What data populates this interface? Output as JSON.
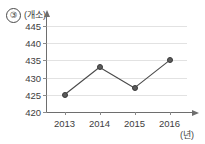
{
  "item_number": "③",
  "chart_data": {
    "type": "line",
    "title": "",
    "xlabel": "(년)",
    "ylabel": "(개소)",
    "categories": [
      "2013",
      "2014",
      "2015",
      "2016"
    ],
    "values": [
      425,
      433,
      427,
      435
    ],
    "series": [
      {
        "name": "개소",
        "values": [
          425,
          433,
          427,
          435
        ]
      }
    ],
    "ylim": [
      420,
      445
    ],
    "yticks": [
      420,
      425,
      430,
      435,
      440,
      445
    ],
    "ytick_labels": [
      "420",
      "425",
      "430",
      "435",
      "440",
      "445"
    ],
    "xticks": [
      "2013",
      "2014",
      "2015",
      "2016"
    ],
    "grid": true,
    "grid_color": "#e2e2e2",
    "legend": false,
    "marker_color": "#5b5b5b",
    "line_color": "#4a4a4a",
    "axis_color": "#6e6e6e"
  }
}
